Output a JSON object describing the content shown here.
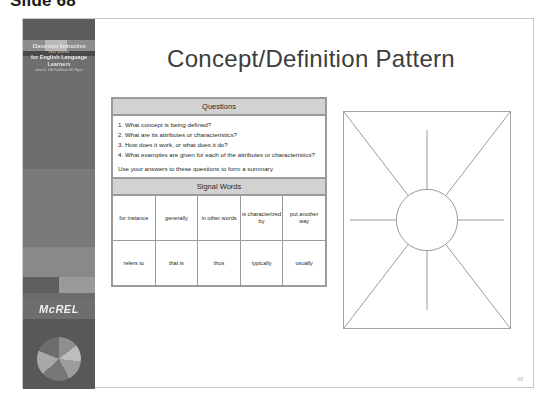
{
  "page": {
    "caption": "Slide 68",
    "number": "68"
  },
  "sidebar": {
    "book": {
      "line1": "Classroom Instruction",
      "line2": "that Works",
      "line3": "for English Language Learners",
      "line4": "Jane D. Hill  Kathleen M. Flynn"
    },
    "logo_text": "McREL",
    "pie_chart_name": "pie-chart-graphic"
  },
  "slide": {
    "title": "Concept/Definition Pattern",
    "organizer": {
      "questions_header": "Questions",
      "questions": [
        "1. What concept is being defined?",
        "2. What are its attributes or characteristics?",
        "3. How does it work, or what does it do?",
        "4. What examples are given for each of the attributes or characteristics?"
      ],
      "summary_line": "Use your answers to these questions to form a summary.",
      "signal_words_header": "Signal Words",
      "signal_words_rows": [
        [
          "for instance",
          "generally",
          "in other words",
          "is characterized by",
          "put another way"
        ],
        [
          "refers to",
          "that is",
          "thus",
          "typically",
          "usually"
        ]
      ]
    },
    "diagram": {
      "name": "concept-definition-web-diagram",
      "shape": "circle-with-eight-radiating-spokes",
      "spokes": 8
    }
  },
  "colors": {
    "header_fill": "#d2d2d2",
    "border": "#9a9a9a",
    "sidebar": "#6e6e6e",
    "title_text": "#3d3d3d"
  }
}
